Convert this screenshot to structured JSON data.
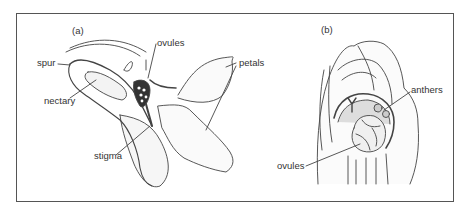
{
  "figure": {
    "panel_a": {
      "label": "(a)",
      "callouts": {
        "ovules": "ovules",
        "spur": "spur",
        "nectary": "nectary",
        "stigma": "stigma",
        "petals": "petals"
      }
    },
    "panel_b": {
      "label": "(b)",
      "callouts": {
        "anthers": "anthers",
        "ovules": "ovules"
      }
    }
  }
}
